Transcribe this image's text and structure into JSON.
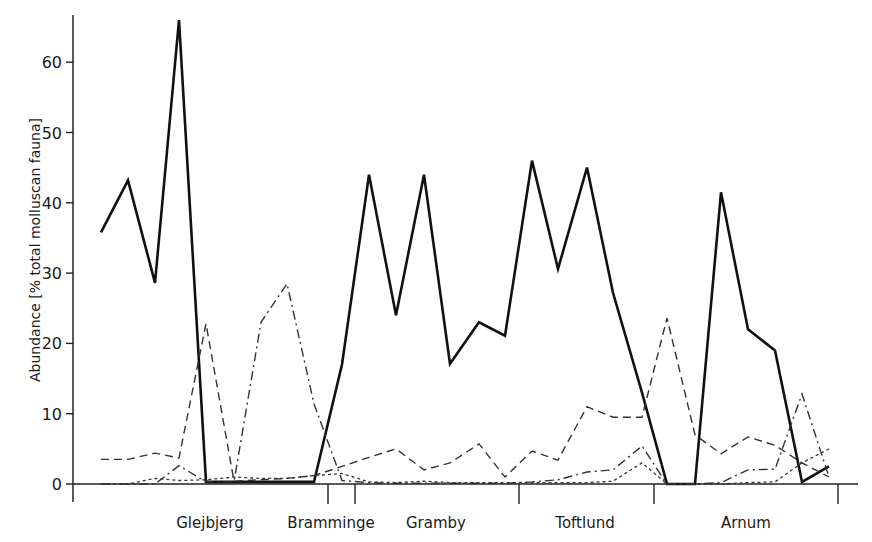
{
  "chart_data": {
    "type": "line",
    "title": "",
    "xlabel": "",
    "ylabel": "Abundance [% total molluscan fauna]",
    "ylim": [
      0,
      66
    ],
    "yticks": [
      0,
      10,
      20,
      30,
      40,
      50,
      60
    ],
    "grid": false,
    "legend": "none",
    "sites": [
      {
        "name": "Glejbjerg",
        "label_x": 210
      },
      {
        "name": "Bramminge",
        "label_x": 331
      },
      {
        "name": "Gramby",
        "label_x": 436
      },
      {
        "name": "Toftlund",
        "label_x": 585
      },
      {
        "name": "Arnum",
        "label_x": 746
      }
    ],
    "site_separators_x": [
      328,
      355,
      519,
      654,
      838
    ],
    "x": [
      101,
      128,
      155,
      179,
      206,
      234,
      261,
      287,
      314,
      342,
      369,
      396,
      424,
      450,
      479,
      505,
      532,
      558,
      587,
      613,
      642,
      667,
      695,
      721,
      748,
      775,
      802,
      829
    ],
    "series": [
      {
        "name": "solid",
        "style": "solid",
        "width": 2.6,
        "values": [
          35.8,
          43.2,
          28.6,
          66.0,
          0.3,
          0.3,
          0.3,
          0.3,
          0.3,
          17.0,
          44.0,
          24.0,
          44.0,
          17.1,
          23.0,
          21.1,
          46.0,
          30.6,
          45.0,
          27.2,
          13.0,
          0.0,
          0.0,
          41.5,
          22.0,
          19.0,
          0.3,
          2.5
        ]
      },
      {
        "name": "dashed",
        "style": "dashed",
        "width": 1.4,
        "values": [
          3.5,
          3.5,
          4.4,
          3.7,
          22.8,
          0.4,
          0.6,
          0.8,
          1.2,
          2.5,
          3.8,
          5.0,
          2.0,
          3.0,
          5.7,
          1.0,
          4.7,
          3.4,
          11.0,
          9.5,
          9.5,
          23.6,
          7.0,
          4.3,
          6.7,
          5.5,
          3.0,
          1.0
        ]
      },
      {
        "name": "dash-dot",
        "style": "dashdot",
        "width": 1.4,
        "values": [
          0.0,
          0.0,
          0.0,
          2.6,
          0.3,
          0.3,
          23.0,
          28.5,
          11.4,
          0.5,
          0.2,
          0.1,
          0.1,
          0.1,
          0.1,
          0.1,
          0.3,
          0.6,
          1.7,
          2.0,
          5.4,
          0.0,
          0.0,
          0.2,
          2.0,
          2.1,
          12.8,
          1.0
        ]
      },
      {
        "name": "dotted",
        "style": "dotted",
        "width": 1.3,
        "values": [
          0.0,
          0.0,
          0.8,
          0.5,
          0.6,
          1.0,
          0.8,
          0.8,
          1.2,
          1.5,
          0.3,
          0.2,
          0.4,
          0.2,
          0.2,
          0.2,
          0.2,
          0.2,
          0.2,
          0.4,
          3.0,
          0.0,
          0.0,
          0.0,
          0.2,
          0.3,
          3.0,
          5.0
        ]
      }
    ]
  },
  "axes": {
    "y_ticks": [
      "0",
      "10",
      "20",
      "30",
      "40",
      "50",
      "60"
    ],
    "y_label": "Abundance [% total molluscan fauna]",
    "site_labels": [
      "Glejbjerg",
      "Bramminge",
      "Gramby",
      "Toftlund",
      "Arnum"
    ]
  }
}
